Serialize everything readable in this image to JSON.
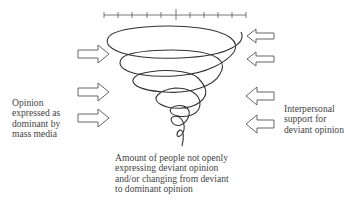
{
  "diagram": {
    "scale": {
      "ticks": 11,
      "center_tick_emphasized": true
    },
    "left_label": {
      "lines": [
        "Opinion",
        "expressed as",
        "dominant by",
        "mass media"
      ]
    },
    "right_label": {
      "lines": [
        "Interpersonal",
        "support for",
        "deviant opinion"
      ]
    },
    "bottom_label": {
      "lines": [
        "Amount of people not openly",
        "expressing deviant opinion",
        "and/or changing from deviant",
        "to dominant opinion"
      ]
    },
    "left_arrows": {
      "count": 3,
      "direction": "right"
    },
    "right_arrows": {
      "count": 4,
      "direction": "left"
    },
    "colors": {
      "stroke": "#3a3a3a",
      "background": "#ffffff"
    }
  }
}
